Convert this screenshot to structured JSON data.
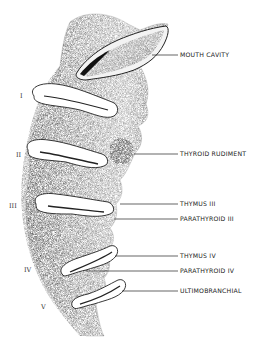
{
  "figure": {
    "type": "anatomical-illustration",
    "labels": [
      {
        "text": "MOUTH CAVITY",
        "x": 180,
        "y": 52,
        "line_from_x": 152,
        "line_y": 55
      },
      {
        "text": "THYROID RUDIMENT",
        "x": 180,
        "y": 151,
        "line_from_x": 134,
        "line_y": 154
      },
      {
        "text": "THYMUS III",
        "x": 180,
        "y": 201,
        "line_from_x": 120,
        "line_y": 204
      },
      {
        "text": "PARATHYROID III",
        "x": 180,
        "y": 216,
        "line_from_x": 114,
        "line_y": 219
      },
      {
        "text": "THYMUS IV",
        "x": 180,
        "y": 253,
        "line_from_x": 115,
        "line_y": 256
      },
      {
        "text": "PARATHYROID IV",
        "x": 180,
        "y": 268,
        "line_from_x": 86,
        "line_y": 271
      },
      {
        "text": "ULTIMOBRANCHIAL",
        "x": 180,
        "y": 288,
        "line_from_x": 122,
        "line_y": 291
      }
    ],
    "arch_numerals": [
      {
        "text": "I",
        "x": 20,
        "y": 93
      },
      {
        "text": "II",
        "x": 16,
        "y": 152
      },
      {
        "text": "III",
        "x": 9,
        "y": 203
      },
      {
        "text": "IV",
        "x": 24,
        "y": 267
      },
      {
        "text": "V",
        "x": 41,
        "y": 304
      }
    ],
    "colors": {
      "ink": "#1a1a1a",
      "stipple_dark": "#3a3a3a",
      "stipple_mid": "#7a7a7a",
      "stipple_light": "#b5b5b5",
      "background": "#ffffff"
    }
  }
}
